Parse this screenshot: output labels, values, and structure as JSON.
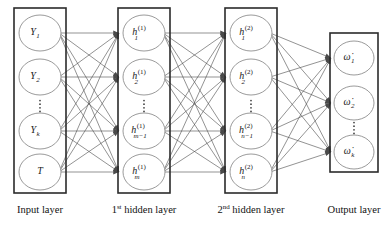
{
  "figure": {
    "background_color": "#ffffff",
    "box_stroke_color": "#2b2b2b",
    "node_stroke_color": "#8e8e8e",
    "edge_color": "#4a4a4a",
    "text_color": "#1a1a1a"
  },
  "layers": [
    {
      "id": "input",
      "caption": "Input layer",
      "caption_prefix": "",
      "caption_ordinal": "",
      "box": {
        "x": 14,
        "y": 8,
        "width": 52,
        "height": 185
      },
      "caption_x": 40,
      "caption_y": 213,
      "nodes": [
        {
          "base": "Y",
          "sub": "1",
          "sup": "",
          "cx": 40,
          "cy": 33
        },
        {
          "base": "Y",
          "sub": "2",
          "sup": "",
          "cx": 40,
          "cy": 77
        },
        {
          "base": "Y",
          "sub": "k",
          "sup": "",
          "cx": 40,
          "cy": 131
        },
        {
          "base": "T",
          "sub": "",
          "sup": "",
          "cx": 40,
          "cy": 172
        }
      ],
      "ellipsis": {
        "cx": 40,
        "cy": 106,
        "dots": 4
      }
    },
    {
      "id": "hidden1",
      "caption": "hidden layer",
      "caption_prefix": "1",
      "caption_ordinal": "st",
      "box": {
        "x": 118,
        "y": 8,
        "width": 52,
        "height": 185
      },
      "caption_x": 144,
      "caption_y": 213,
      "nodes": [
        {
          "base": "h",
          "sub": "1",
          "sup": "(1)",
          "cx": 144,
          "cy": 33
        },
        {
          "base": "h",
          "sub": "2",
          "sup": "(1)",
          "cx": 144,
          "cy": 77
        },
        {
          "base": "h",
          "sub": "m−1",
          "sup": "(1)",
          "cx": 144,
          "cy": 131
        },
        {
          "base": "h",
          "sub": "m",
          "sup": "(1)",
          "cx": 144,
          "cy": 172
        }
      ],
      "ellipsis": {
        "cx": 144,
        "cy": 106,
        "dots": 4
      }
    },
    {
      "id": "hidden2",
      "caption": "hidden layer",
      "caption_prefix": "2",
      "caption_ordinal": "nd",
      "box": {
        "x": 225,
        "y": 8,
        "width": 52,
        "height": 185
      },
      "caption_x": 251,
      "caption_y": 213,
      "nodes": [
        {
          "base": "h",
          "sub": "1",
          "sup": "(2)",
          "cx": 251,
          "cy": 33
        },
        {
          "base": "h",
          "sub": "2",
          "sup": "(2)",
          "cx": 251,
          "cy": 77
        },
        {
          "base": "h",
          "sub": "n−1",
          "sup": "(2)",
          "cx": 251,
          "cy": 131
        },
        {
          "base": "h",
          "sub": "n",
          "sup": "(2)",
          "cx": 251,
          "cy": 172
        }
      ],
      "ellipsis": {
        "cx": 251,
        "cy": 106,
        "dots": 4
      }
    },
    {
      "id": "output",
      "caption": "Output layer",
      "caption_prefix": "",
      "caption_ordinal": "",
      "box": {
        "x": 330,
        "y": 33,
        "width": 48,
        "height": 139
      },
      "caption_x": 354,
      "caption_y": 213,
      "nodes": [
        {
          "base": "ω̇",
          "sub": "1",
          "sup": "",
          "cx": 354,
          "cy": 58
        },
        {
          "base": "ω̇",
          "sub": "2",
          "sup": "",
          "cx": 354,
          "cy": 103
        },
        {
          "base": "ω̇",
          "sub": "k",
          "sup": "",
          "cx": 354,
          "cy": 152
        }
      ],
      "ellipsis": {
        "cx": 354,
        "cy": 128,
        "dots": 4
      }
    }
  ],
  "node_shape": {
    "rx": 21,
    "ry": 18,
    "rx_output": 20,
    "ry_output": 17
  },
  "connections": [
    {
      "from": "input",
      "to": "hidden1",
      "fully_connected": true
    },
    {
      "from": "hidden1",
      "to": "hidden2",
      "fully_connected": true
    },
    {
      "from": "hidden2",
      "to": "output",
      "fully_connected": true
    }
  ],
  "edge_style": {
    "arrowhead": true,
    "arrow_size": 3.4,
    "direction": "left-to-right"
  }
}
